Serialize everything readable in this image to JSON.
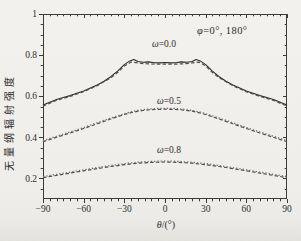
{
  "labels": {
    "ylabel": "无量纲辐射强度",
    "xlabel_symbol": "θ",
    "xlabel_rest": "/(°)",
    "annotation_symbol": "φ",
    "annotation_rest": "=0°, 180°",
    "series_labels": [
      {
        "symbol": "ω",
        "rest": "=0.0"
      },
      {
        "symbol": "ω",
        "rest": "=0.5"
      },
      {
        "symbol": "ω",
        "rest": "=0.8"
      }
    ]
  },
  "chart_data": {
    "type": "line",
    "title": "",
    "xlabel": "θ/(°)",
    "ylabel": "无量纲辐射强度",
    "annotation": "φ=0°, 180°",
    "xlim": [
      -90,
      90
    ],
    "ylim": [
      0.1,
      1.0
    ],
    "grid": false,
    "legend_position": "inline-labels",
    "axis_color": "#3c3b39",
    "x_ticks": [
      {
        "v": -90,
        "label": "−90"
      },
      {
        "v": -60,
        "label": "−60"
      },
      {
        "v": -30,
        "label": "−30"
      },
      {
        "v": 0,
        "label": "0"
      },
      {
        "v": 30,
        "label": "30"
      },
      {
        "v": 60,
        "label": "60"
      },
      {
        "v": 90,
        "label": "90"
      }
    ],
    "x_minor_step": 5,
    "y_ticks": [
      {
        "v": 0.2,
        "label": "0.2"
      },
      {
        "v": 0.4,
        "label": "0.4"
      },
      {
        "v": 0.6,
        "label": "0.6"
      },
      {
        "v": 0.8,
        "label": "0.8"
      },
      {
        "v": 1.0,
        "label": "1"
      }
    ],
    "y_minor_step": 0.05,
    "series": [
      {
        "name": "omega=0.0 solid",
        "group": "ω=0.0",
        "style": "solid",
        "color": "#2b2b2b",
        "width": 1.1,
        "points": [
          [
            -90,
            0.558
          ],
          [
            -85,
            0.571
          ],
          [
            -80,
            0.584
          ],
          [
            -75,
            0.594
          ],
          [
            -70,
            0.603
          ],
          [
            -65,
            0.614
          ],
          [
            -60,
            0.626
          ],
          [
            -55,
            0.64
          ],
          [
            -50,
            0.655
          ],
          [
            -45,
            0.673
          ],
          [
            -40,
            0.695
          ],
          [
            -35,
            0.722
          ],
          [
            -30,
            0.754
          ],
          [
            -26,
            0.772
          ],
          [
            -23,
            0.778
          ],
          [
            -20,
            0.769
          ],
          [
            -16,
            0.765
          ],
          [
            -12,
            0.767
          ],
          [
            -8,
            0.763
          ],
          [
            -4,
            0.762
          ],
          [
            0,
            0.764
          ],
          [
            4,
            0.762
          ],
          [
            8,
            0.763
          ],
          [
            12,
            0.767
          ],
          [
            16,
            0.765
          ],
          [
            20,
            0.769
          ],
          [
            23,
            0.778
          ],
          [
            26,
            0.772
          ],
          [
            30,
            0.754
          ],
          [
            35,
            0.722
          ],
          [
            40,
            0.695
          ],
          [
            45,
            0.673
          ],
          [
            50,
            0.655
          ],
          [
            55,
            0.64
          ],
          [
            60,
            0.626
          ],
          [
            65,
            0.614
          ],
          [
            70,
            0.603
          ],
          [
            75,
            0.594
          ],
          [
            80,
            0.584
          ],
          [
            85,
            0.571
          ],
          [
            90,
            0.558
          ]
        ]
      },
      {
        "name": "omega=0.0 dashed",
        "group": "ω=0.0",
        "style": "dashed",
        "color": "#4f4f4f",
        "width": 1.2,
        "points": [
          [
            -90,
            0.552
          ],
          [
            -80,
            0.58
          ],
          [
            -70,
            0.599
          ],
          [
            -60,
            0.622
          ],
          [
            -50,
            0.651
          ],
          [
            -40,
            0.69
          ],
          [
            -35,
            0.715
          ],
          [
            -30,
            0.747
          ],
          [
            -25,
            0.766
          ],
          [
            -20,
            0.762
          ],
          [
            -15,
            0.758
          ],
          [
            -10,
            0.757
          ],
          [
            -5,
            0.756
          ],
          [
            0,
            0.757
          ],
          [
            5,
            0.756
          ],
          [
            10,
            0.757
          ],
          [
            15,
            0.758
          ],
          [
            20,
            0.762
          ],
          [
            25,
            0.766
          ],
          [
            30,
            0.747
          ],
          [
            35,
            0.715
          ],
          [
            40,
            0.69
          ],
          [
            50,
            0.651
          ],
          [
            60,
            0.622
          ],
          [
            70,
            0.599
          ],
          [
            80,
            0.58
          ],
          [
            90,
            0.552
          ]
        ]
      },
      {
        "name": "omega=0.5 dashed",
        "group": "ω=0.5",
        "style": "dashed",
        "color": "#4f4f4f",
        "width": 1.2,
        "points": [
          [
            -90,
            0.379
          ],
          [
            -80,
            0.4
          ],
          [
            -70,
            0.421
          ],
          [
            -60,
            0.443
          ],
          [
            -50,
            0.466
          ],
          [
            -40,
            0.489
          ],
          [
            -30,
            0.511
          ],
          [
            -25,
            0.52
          ],
          [
            -20,
            0.527
          ],
          [
            -15,
            0.532
          ],
          [
            -10,
            0.535
          ],
          [
            -5,
            0.536
          ],
          [
            0,
            0.537
          ],
          [
            5,
            0.536
          ],
          [
            10,
            0.535
          ],
          [
            15,
            0.532
          ],
          [
            20,
            0.527
          ],
          [
            25,
            0.52
          ],
          [
            30,
            0.511
          ],
          [
            40,
            0.489
          ],
          [
            50,
            0.466
          ],
          [
            60,
            0.443
          ],
          [
            70,
            0.421
          ],
          [
            80,
            0.4
          ],
          [
            90,
            0.379
          ]
        ]
      },
      {
        "name": "omega=0.5 dotted",
        "group": "ω=0.5",
        "style": "dotted",
        "color": "#6e6e6e",
        "width": 1.3,
        "points": [
          [
            -90,
            0.384
          ],
          [
            -80,
            0.405
          ],
          [
            -70,
            0.426
          ],
          [
            -60,
            0.448
          ],
          [
            -50,
            0.471
          ],
          [
            -40,
            0.494
          ],
          [
            -30,
            0.515
          ],
          [
            -25,
            0.524
          ],
          [
            -20,
            0.531
          ],
          [
            -15,
            0.536
          ],
          [
            -10,
            0.539
          ],
          [
            -5,
            0.541
          ],
          [
            0,
            0.541
          ],
          [
            5,
            0.541
          ],
          [
            10,
            0.539
          ],
          [
            15,
            0.536
          ],
          [
            20,
            0.531
          ],
          [
            25,
            0.524
          ],
          [
            30,
            0.515
          ],
          [
            40,
            0.494
          ],
          [
            50,
            0.471
          ],
          [
            60,
            0.448
          ],
          [
            70,
            0.426
          ],
          [
            80,
            0.405
          ],
          [
            90,
            0.384
          ]
        ]
      },
      {
        "name": "omega=0.8 dashed",
        "group": "ω=0.8",
        "style": "dashed",
        "color": "#4f4f4f",
        "width": 1.2,
        "points": [
          [
            -90,
            0.204
          ],
          [
            -80,
            0.215
          ],
          [
            -70,
            0.226
          ],
          [
            -60,
            0.237
          ],
          [
            -50,
            0.248
          ],
          [
            -40,
            0.258
          ],
          [
            -30,
            0.267
          ],
          [
            -20,
            0.274
          ],
          [
            -10,
            0.278
          ],
          [
            0,
            0.28
          ],
          [
            10,
            0.278
          ],
          [
            20,
            0.274
          ],
          [
            30,
            0.267
          ],
          [
            40,
            0.258
          ],
          [
            50,
            0.248
          ],
          [
            60,
            0.237
          ],
          [
            70,
            0.226
          ],
          [
            80,
            0.215
          ],
          [
            90,
            0.204
          ]
        ]
      },
      {
        "name": "omega=0.8 dotted",
        "group": "ω=0.8",
        "style": "dotted",
        "color": "#6e6e6e",
        "width": 1.3,
        "points": [
          [
            -90,
            0.209
          ],
          [
            -80,
            0.22
          ],
          [
            -70,
            0.231
          ],
          [
            -60,
            0.242
          ],
          [
            -50,
            0.253
          ],
          [
            -40,
            0.263
          ],
          [
            -30,
            0.272
          ],
          [
            -20,
            0.279
          ],
          [
            -10,
            0.283
          ],
          [
            0,
            0.285
          ],
          [
            10,
            0.283
          ],
          [
            20,
            0.279
          ],
          [
            30,
            0.272
          ],
          [
            40,
            0.263
          ],
          [
            50,
            0.253
          ],
          [
            60,
            0.242
          ],
          [
            70,
            0.231
          ],
          [
            80,
            0.22
          ],
          [
            90,
            0.209
          ]
        ]
      }
    ]
  }
}
